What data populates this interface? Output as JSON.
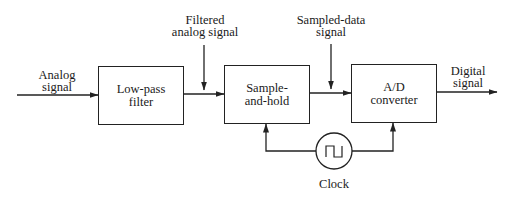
{
  "diagram": {
    "type": "block-diagram",
    "blocks": [
      {
        "id": "lpf",
        "lines": [
          "Low-pass",
          "filter"
        ]
      },
      {
        "id": "sh",
        "lines": [
          "Sample-",
          "and-hold"
        ]
      },
      {
        "id": "adc",
        "lines": [
          "A/D",
          "converter"
        ]
      }
    ],
    "signals": {
      "input": [
        "Analog",
        "signal"
      ],
      "filtered": [
        "Filtered",
        "analog signal"
      ],
      "sampled": [
        "Sampled-data",
        "signal"
      ],
      "output": [
        "Digital",
        "signal"
      ]
    },
    "clock": {
      "label": "Clock",
      "icon": "square-wave-icon"
    },
    "edges": [
      {
        "from": "input",
        "to": "lpf",
        "label": "Analog signal"
      },
      {
        "from": "lpf",
        "to": "sh",
        "label": "Filtered analog signal"
      },
      {
        "from": "sh",
        "to": "adc",
        "label": "Sampled-data signal"
      },
      {
        "from": "adc",
        "to": "output",
        "label": "Digital signal"
      },
      {
        "from": "clock",
        "to": "sh"
      },
      {
        "from": "clock",
        "to": "adc"
      }
    ],
    "colors": {
      "line": "#222222",
      "background": "#ffffff"
    }
  }
}
